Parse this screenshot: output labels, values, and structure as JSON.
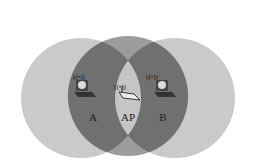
{
  "diagram": {
    "labels": {
      "a": "A",
      "ap": "AP",
      "b": "B"
    },
    "icons": {
      "station_a": "laptop-icon",
      "access_point": "router-icon",
      "station_b": "laptop-icon",
      "signal": "wireless-signal-icon"
    },
    "colors": {
      "outer": "#c9c9c9",
      "middle": "#9a9a9a",
      "overlap": "#6f6f6f",
      "center_lens": "#c4c4c4"
    }
  }
}
